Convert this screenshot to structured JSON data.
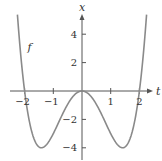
{
  "chart_data": {
    "type": "line",
    "title": "",
    "xlabel": "t",
    "ylabel": "x",
    "series": [
      {
        "name": "f",
        "function": "t^4 - 4t^2",
        "x": [
          -2.2,
          -2.0,
          -1.8,
          -1.6,
          -1.414,
          -1.2,
          -1.0,
          -0.8,
          -0.6,
          -0.4,
          -0.2,
          0.0,
          0.2,
          0.4,
          0.6,
          0.8,
          1.0,
          1.2,
          1.414,
          1.6,
          1.8,
          2.0,
          2.2
        ],
        "values": [
          4.07,
          0.0,
          -2.46,
          -3.69,
          -4.0,
          -3.69,
          -3.0,
          -2.15,
          -1.31,
          -0.61,
          -0.16,
          0.0,
          -0.16,
          -0.61,
          -1.31,
          -2.15,
          -3.0,
          -3.69,
          -4.0,
          -3.69,
          -2.46,
          0.0,
          4.07
        ]
      }
    ],
    "xticks": [
      -2,
      -1,
      1,
      2
    ],
    "xtick_labels": [
      "−2",
      "−1",
      "1",
      "2"
    ],
    "yticks": [
      4,
      2,
      -2,
      -4
    ],
    "ytick_labels": [
      "4",
      "2",
      "−2",
      "−4"
    ],
    "xlim": [
      -2.6,
      2.6
    ],
    "ylim": [
      -4.8,
      5.9
    ],
    "grid": false,
    "annotations": [
      {
        "text": "f",
        "t": -1.9,
        "x": 2.8
      }
    ],
    "curve_color": "#8a8a8a",
    "axis_color": "#555555"
  }
}
